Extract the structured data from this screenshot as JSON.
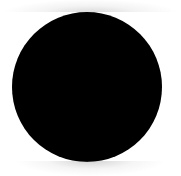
{
  "image": {
    "kind": "geometric-figure",
    "description": "Solid black filled circle centered on a white background",
    "width_px": 181,
    "height_px": 176,
    "background_color": "#ffffff",
    "has_text": false,
    "has_ui_chrome": false
  },
  "shapes": [
    {
      "name": "black-circle",
      "type": "circle",
      "fill_color": "#000000",
      "stroke_color": "none",
      "stroke_width_px": 0,
      "center_x_px": 86.5,
      "center_y_px": 86.5,
      "diameter_px": 150,
      "radius_px": 75,
      "left_px": 11.5,
      "top_px": 11.5,
      "edge_softness": "antialiased"
    }
  ],
  "artifacts": [
    {
      "name": "top-compression-haze",
      "color": "#7a7a7d",
      "position": "above-circle",
      "opacity": 0.3
    },
    {
      "name": "bottom-compression-haze",
      "color": "#6e6e73",
      "position": "below-circle",
      "opacity": 0.32
    }
  ]
}
